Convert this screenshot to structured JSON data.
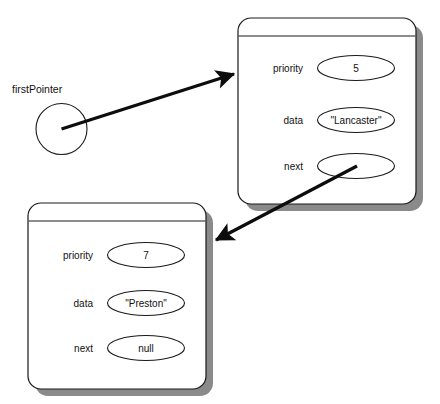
{
  "diagram": {
    "background_color": "#ffffff",
    "line_color": "#1a1a1a",
    "shadow_color": "#8a8a8a",
    "pointer": {
      "label": "firstPointer",
      "shape": "circle"
    },
    "nodes": [
      {
        "id": "node-1",
        "slots": [
          {
            "label": "priority",
            "value": "5"
          },
          {
            "label": "data",
            "value": "\"Lancaster\""
          },
          {
            "label": "next",
            "value": ""
          }
        ]
      },
      {
        "id": "node-2",
        "slots": [
          {
            "label": "priority",
            "value": "7"
          },
          {
            "label": "data",
            "value": "\"Preston\""
          },
          {
            "label": "next",
            "value": "null"
          }
        ]
      }
    ],
    "arrows": [
      {
        "name": "first-pointer-to-node-1",
        "from": "firstPointer",
        "to": "node-1"
      },
      {
        "name": "node-1-next-to-node-2",
        "from": "node-1.next",
        "to": "node-2"
      }
    ]
  }
}
